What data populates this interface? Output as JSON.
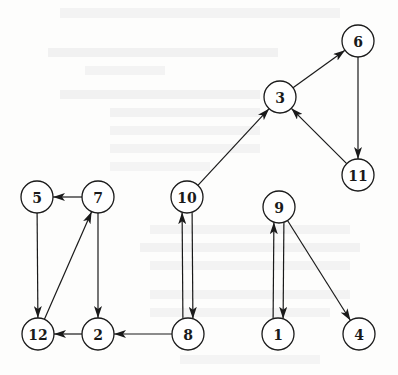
{
  "diagram": {
    "type": "directed-graph",
    "node_radius": 16,
    "stroke_color": "#1a1a1a",
    "fill_color": "#ffffff",
    "nodes": [
      {
        "id": "1",
        "label": "1",
        "x": 278,
        "y": 334
      },
      {
        "id": "2",
        "label": "2",
        "x": 98,
        "y": 334
      },
      {
        "id": "3",
        "label": "3",
        "x": 280,
        "y": 97
      },
      {
        "id": "4",
        "label": "4",
        "x": 359,
        "y": 334
      },
      {
        "id": "5",
        "label": "5",
        "x": 37,
        "y": 197
      },
      {
        "id": "6",
        "label": "6",
        "x": 358,
        "y": 41
      },
      {
        "id": "7",
        "label": "7",
        "x": 98,
        "y": 197
      },
      {
        "id": "8",
        "label": "8",
        "x": 188,
        "y": 334
      },
      {
        "id": "9",
        "label": "9",
        "x": 279,
        "y": 207
      },
      {
        "id": "10",
        "label": "10",
        "x": 187,
        "y": 197
      },
      {
        "id": "11",
        "label": "11",
        "x": 358,
        "y": 175
      },
      {
        "id": "12",
        "label": "12",
        "x": 38,
        "y": 334
      }
    ],
    "edges": [
      {
        "from": "3",
        "to": "6"
      },
      {
        "from": "6",
        "to": "11"
      },
      {
        "from": "11",
        "to": "3"
      },
      {
        "from": "10",
        "to": "3"
      },
      {
        "from": "7",
        "to": "5"
      },
      {
        "from": "5",
        "to": "12"
      },
      {
        "from": "12",
        "to": "7"
      },
      {
        "from": "7",
        "to": "2"
      },
      {
        "from": "2",
        "to": "12"
      },
      {
        "from": "8",
        "to": "2"
      },
      {
        "from": "8",
        "to": "10",
        "offset": -5
      },
      {
        "from": "10",
        "to": "8",
        "offset": -5
      },
      {
        "from": "1",
        "to": "9",
        "offset": -5
      },
      {
        "from": "9",
        "to": "1",
        "offset": -5
      },
      {
        "from": "9",
        "to": "4"
      }
    ]
  }
}
